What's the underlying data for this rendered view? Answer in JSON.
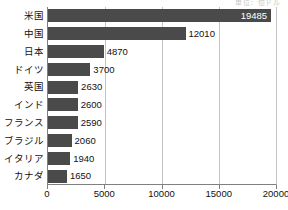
{
  "header": {
    "cropped_text": "単位：億ドル"
  },
  "chart_data": {
    "type": "bar",
    "orientation": "horizontal",
    "title": "",
    "subtitle": "",
    "xlabel": "",
    "ylabel": "",
    "categories": [
      "米国",
      "中国",
      "日本",
      "ドイツ",
      "英国",
      "インド",
      "フランス",
      "ブラジル",
      "イタリア",
      "カナダ"
    ],
    "values": [
      19485,
      12010,
      4870,
      3700,
      2630,
      2600,
      2590,
      2060,
      1940,
      1650
    ],
    "value_labels": [
      "19485",
      "12010",
      "4870",
      "3700",
      "2630",
      "2600",
      "2590",
      "2060",
      "1940",
      "1650"
    ],
    "label_placement": [
      "inside",
      "outside",
      "outside",
      "outside",
      "outside",
      "outside",
      "outside",
      "outside",
      "outside",
      "outside"
    ],
    "xlim": [
      0,
      20000
    ],
    "xticks": [
      0,
      5000,
      10000,
      15000,
      20000
    ],
    "xtick_labels": [
      "0",
      "5000",
      "10000",
      "15000",
      "20000"
    ],
    "grid": true,
    "grid_axis": "x",
    "legend": null,
    "bar_color": "#4a4a4a",
    "grid_color": "#c4c4c4",
    "axis_color": "#808080",
    "background": "#ffffff"
  }
}
